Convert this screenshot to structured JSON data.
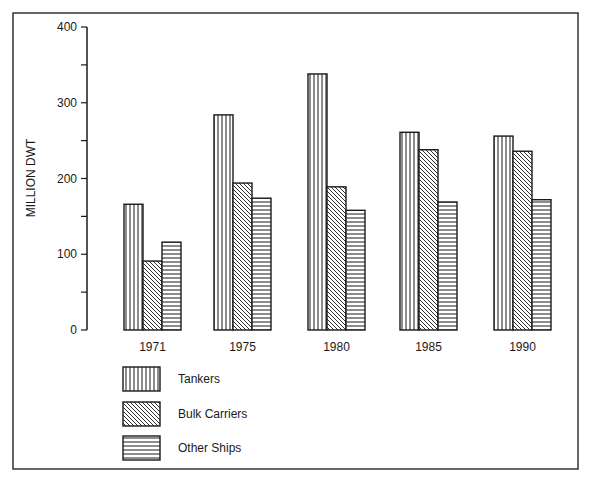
{
  "chart_data": {
    "type": "bar",
    "title": "",
    "xlabel": "",
    "ylabel": "MILLION DWT",
    "ylim": [
      0,
      400
    ],
    "yticks": [
      0,
      100,
      200,
      300,
      400
    ],
    "grid": false,
    "legend_position": "bottom-left",
    "categories": [
      "1971",
      "1975",
      "1980",
      "1985",
      "1990"
    ],
    "series": [
      {
        "name": "Tankers",
        "pattern": "vertical-lines",
        "values": [
          166,
          284,
          338,
          261,
          256
        ]
      },
      {
        "name": "Bulk Carriers",
        "pattern": "diagonal-lines",
        "values": [
          91,
          194,
          189,
          238,
          236
        ]
      },
      {
        "name": "Other Ships",
        "pattern": "horizontal-lines",
        "values": [
          116,
          174,
          158,
          169,
          172
        ]
      }
    ]
  },
  "colors": {
    "ink": "#1a1a1a",
    "background": "#ffffff"
  }
}
